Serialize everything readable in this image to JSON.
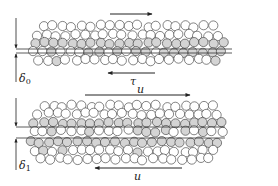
{
  "figure": {
    "colors": {
      "particle_white": "#ffffff",
      "particle_gray": "#d4d4d4",
      "stroke": "#333333",
      "background": "#ffffff"
    },
    "top_panel": {
      "gap_label": "δ",
      "gap_subscript": "0",
      "shear_label": "τ",
      "top_arrow_direction": "right",
      "bottom_arrow_direction": "left"
    },
    "bottom_panel": {
      "gap_label": "δ",
      "gap_subscript": "1",
      "top_velocity_label": "u",
      "bottom_velocity_label": "u",
      "top_arrow_direction": "right",
      "bottom_arrow_direction": "left"
    }
  }
}
